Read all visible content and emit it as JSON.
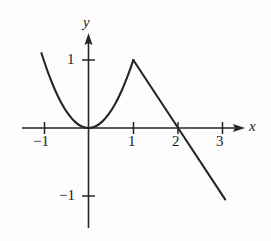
{
  "figure": {
    "background_color": "#fdfdfd",
    "ink_color": "#262626"
  },
  "chart_data": {
    "type": "line",
    "title": "",
    "subtitle": "",
    "xlabel": "x",
    "ylabel": "y",
    "xlim": [
      -1.5,
      3.6
    ],
    "ylim": [
      -1.5,
      1.45
    ],
    "grid": false,
    "legend": null,
    "axis_arrows": {
      "x": "right",
      "y": "up"
    },
    "x_ticks": [
      -1,
      1,
      2,
      3
    ],
    "x_tick_labels": [
      "−1",
      "1",
      "2",
      "3"
    ],
    "y_ticks": [
      1,
      -1
    ],
    "y_tick_labels": [
      "1",
      "−1"
    ],
    "annotations": [],
    "series": [
      {
        "name": "parabolic branch",
        "type": "line",
        "description": "y = x^2 on the interval from x = -1.05 to x = 1, touching the origin tangentially and rising to the corner point (1, 1)",
        "x": [
          -1.05,
          -0.9,
          -0.75,
          -0.6,
          -0.45,
          -0.3,
          -0.15,
          0,
          0.15,
          0.3,
          0.45,
          0.6,
          0.75,
          0.9,
          1
        ],
        "y": [
          1.1,
          0.81,
          0.5625,
          0.36,
          0.2025,
          0.09,
          0.0225,
          0,
          0.0225,
          0.09,
          0.2025,
          0.36,
          0.5625,
          0.81,
          1
        ]
      },
      {
        "name": "descending line branch",
        "type": "line",
        "description": "straight segment of slope -1 from the corner point (1, 1) through the x-intercept (2, 0) down to about (3.05, -1.05)",
        "x": [
          1,
          2,
          3.05
        ],
        "y": [
          1,
          0,
          -1.05
        ]
      }
    ],
    "key_points": [
      {
        "label": "corner / maximum",
        "x": 1,
        "y": 1
      },
      {
        "label": "origin touch point",
        "x": 0,
        "y": 0
      },
      {
        "label": "x-intercept",
        "x": 2,
        "y": 0
      }
    ]
  },
  "labels": {
    "x_axis": "x",
    "y_axis": "y",
    "x_minus_one": "−1",
    "x_one": "1",
    "x_two": "2",
    "x_three": "3",
    "y_one": "1",
    "y_minus_one": "−1"
  }
}
